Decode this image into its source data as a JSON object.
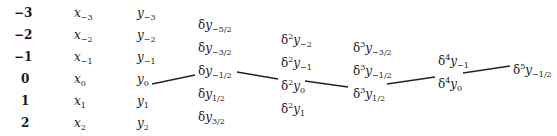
{
  "table": {
    "title": "Central difference table",
    "index_column": [
      "-3",
      "-2",
      "-1",
      "0",
      "1",
      "2"
    ],
    "x_column": [
      {
        "base": "x",
        "sub": "-3"
      },
      {
        "base": "x",
        "sub": "-2"
      },
      {
        "base": "x",
        "sub": "-1"
      },
      {
        "base": "x",
        "sub": "0"
      },
      {
        "base": "x",
        "sub": "1"
      },
      {
        "base": "x",
        "sub": "2"
      }
    ],
    "y_column": [
      {
        "base": "y",
        "sub": "-3"
      },
      {
        "base": "y",
        "sub": "-2"
      },
      {
        "base": "y",
        "sub": "-1"
      },
      {
        "base": "y",
        "sub": "0"
      },
      {
        "base": "y",
        "sub": "1"
      },
      {
        "base": "y",
        "sub": "2"
      }
    ],
    "delta1": [
      {
        "prefix": "δ",
        "pow": "",
        "base": "y",
        "sub": "-5/2"
      },
      {
        "prefix": "δ",
        "pow": "",
        "base": "y",
        "sub": "-3/2"
      },
      {
        "prefix": "δ",
        "pow": "",
        "base": "y",
        "sub": "-1/2"
      },
      {
        "prefix": "δ",
        "pow": "",
        "base": "y",
        "sub": "1/2"
      },
      {
        "prefix": "δ",
        "pow": "",
        "base": "y",
        "sub": "3/2"
      }
    ],
    "delta2": [
      {
        "prefix": "δ",
        "pow": "2",
        "base": "y",
        "sub": "-2"
      },
      {
        "prefix": "δ",
        "pow": "2",
        "base": "y",
        "sub": "-1"
      },
      {
        "prefix": "δ",
        "pow": "2",
        "base": "y",
        "sub": "0"
      },
      {
        "prefix": "δ",
        "pow": "2",
        "base": "y",
        "sub": "1"
      }
    ],
    "delta3": [
      {
        "prefix": "δ",
        "pow": "3",
        "base": "y",
        "sub": "-3/2"
      },
      {
        "prefix": "δ",
        "pow": "3",
        "base": "y",
        "sub": "-1/2"
      },
      {
        "prefix": "δ",
        "pow": "3",
        "base": "y",
        "sub": "1/2"
      }
    ],
    "delta4": [
      {
        "prefix": "δ",
        "pow": "4",
        "base": "y",
        "sub": "-1"
      },
      {
        "prefix": "δ",
        "pow": "4",
        "base": "y",
        "sub": "0"
      }
    ],
    "delta5": [
      {
        "prefix": "δ",
        "pow": "5",
        "base": "y",
        "sub": "-1/2"
      }
    ],
    "path_description": "y0 → δy(-1/2) → δ²y0 → δ³y(1/2) → δ⁴y0 → δ⁵y(-1/2)"
  }
}
